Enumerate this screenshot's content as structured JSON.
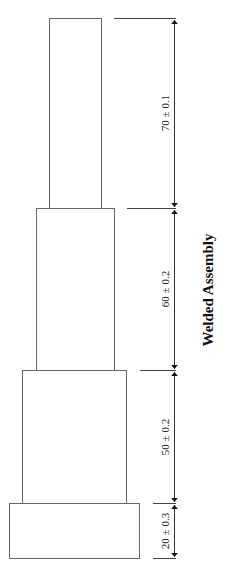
{
  "diagram": {
    "title": "Welded Assembly",
    "sections": [
      {
        "name": "section-4-top",
        "dimension": "70 ± 0.1",
        "nominal": 70,
        "tolerance": 0.1
      },
      {
        "name": "section-3",
        "dimension": "60 ± 0.2",
        "nominal": 60,
        "tolerance": 0.2
      },
      {
        "name": "section-2",
        "dimension": "50 ± 0.2",
        "nominal": 50,
        "tolerance": 0.2
      },
      {
        "name": "section-1-base",
        "dimension": "20 ± 0.3",
        "nominal": 20,
        "tolerance": 0.3
      }
    ],
    "colors": {
      "line": "#555555",
      "text": "#222222"
    }
  }
}
